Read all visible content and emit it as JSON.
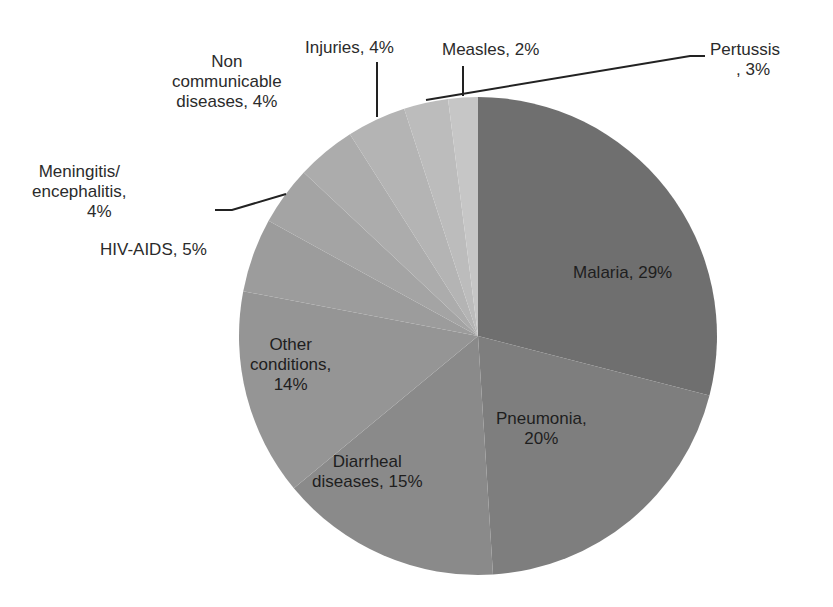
{
  "chart_data": {
    "type": "pie",
    "title": "",
    "start_angle_deg": 0,
    "direction": "clockwise",
    "slices": [
      {
        "label": "Malaria",
        "value": 29,
        "color": "#6f6f6f"
      },
      {
        "label": "Pneumonia",
        "value": 20,
        "color": "#7e7e7e"
      },
      {
        "label": "Diarrheal diseases",
        "value": 15,
        "color": "#8a8a8a"
      },
      {
        "label": "Other conditions",
        "value": 14,
        "color": "#959595"
      },
      {
        "label": "HIV-AIDS",
        "value": 5,
        "color": "#9c9c9c"
      },
      {
        "label": "Meningitis/ encephalitis",
        "value": 4,
        "color": "#a4a4a4"
      },
      {
        "label": "Non communicable diseases",
        "value": 4,
        "color": "#acacac"
      },
      {
        "label": "Injuries",
        "value": 4,
        "color": "#b4b4b4"
      },
      {
        "label": "Pertussis",
        "value": 3,
        "color": "#bcbcbc"
      },
      {
        "label": "Measles",
        "value": 2,
        "color": "#c6c6c6"
      }
    ]
  },
  "labels": {
    "malaria": "Malaria, 29%",
    "pneumonia_1": "Pneumonia,",
    "pneumonia_2": "20%",
    "diarrheal_1": "Diarrheal",
    "diarrheal_2": "diseases, 15%",
    "other_1": "Other",
    "other_2": "conditions,",
    "other_3": "14%",
    "hiv": "HIV-AIDS, 5%",
    "meningitis_1": "Meningitis/",
    "meningitis_2": "encephalitis,",
    "meningitis_3": "4%",
    "ncd_1": "Non",
    "ncd_2": "communicable",
    "ncd_3": "diseases, 4%",
    "injuries": "Injuries, 4%",
    "measles": "Measles, 2%",
    "pertussis_1": "Pertussis",
    "pertussis_2": ", 3%"
  }
}
